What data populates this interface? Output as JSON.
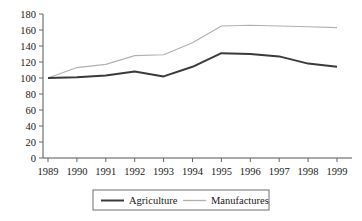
{
  "chart_data": {
    "type": "line",
    "title": "",
    "subtitle": "",
    "xlabel": "",
    "ylabel": "",
    "x": [
      1989,
      1990,
      1991,
      1992,
      1993,
      1994,
      1995,
      1996,
      1997,
      1998,
      1999
    ],
    "categories": [
      "1989",
      "1990",
      "1991",
      "1992",
      "1993",
      "1994",
      "1995",
      "1996",
      "1997",
      "1998",
      "1999"
    ],
    "series": [
      {
        "name": "Agriculture",
        "color": "#3a3a3a",
        "line_style": "solid-thick",
        "values": [
          100,
          101,
          103,
          108,
          102,
          114,
          131,
          130,
          127,
          118,
          114
        ]
      },
      {
        "name": "Manufactures",
        "color": "#b0b0b0",
        "line_style": "solid-thin",
        "values": [
          100,
          113,
          117,
          128,
          129,
          144,
          165,
          166,
          165,
          164,
          163
        ]
      }
    ],
    "ylim": [
      0,
      180
    ],
    "yticks": [
      0,
      20,
      40,
      60,
      80,
      100,
      120,
      140,
      160,
      180
    ],
    "ytick_labels": [
      "0",
      "20",
      "40",
      "60",
      "80",
      "100",
      "120",
      "140",
      "160",
      "180"
    ],
    "xtick_labels": [
      "1989",
      "1990",
      "1991",
      "1992",
      "1993",
      "1994",
      "1995",
      "1996",
      "1997",
      "1998",
      "1999"
    ],
    "grid": false,
    "legend_position": "bottom",
    "legend_entries": [
      "Agriculture",
      "Manufactures"
    ]
  }
}
